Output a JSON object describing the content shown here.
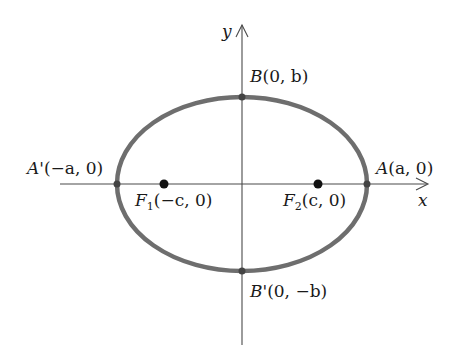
{
  "diagram": {
    "type": "ellipse",
    "axes": {
      "x_label": "x",
      "y_label": "y"
    },
    "colors": {
      "ellipse": "#6e6e6e",
      "axis": "#4a4a4a",
      "point": "#111111"
    },
    "points": {
      "A": {
        "name": "A",
        "coords": "(a, 0)"
      },
      "A_prime": {
        "name": "A'",
        "coords": "(−a, 0)"
      },
      "B": {
        "name": "B",
        "coords": "(0, b)"
      },
      "B_prime": {
        "name": "B'",
        "coords": "(0, −b)"
      },
      "F1": {
        "name": "F",
        "sub": "1",
        "coords": "(−c, 0)"
      },
      "F2": {
        "name": "F",
        "sub": "2",
        "coords": "(c, 0)"
      }
    }
  }
}
